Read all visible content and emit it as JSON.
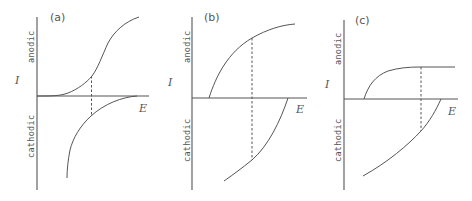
{
  "figure": {
    "panels": [
      {
        "id": "a",
        "label": "(a)",
        "y_upper_label": "anodic",
        "y_lower_label": "cathodic",
        "y_axis_label": "I",
        "x_axis_label": "E"
      },
      {
        "id": "b",
        "label": "(b)",
        "y_upper_label": "anodic",
        "y_lower_label": "cathodic",
        "y_axis_label": "I",
        "x_axis_label": "E"
      },
      {
        "id": "c",
        "label": "(c)",
        "y_upper_label": "anodic",
        "y_lower_label": "cathodic",
        "y_axis_label": "I",
        "x_axis_label": "E"
      }
    ],
    "colors": {
      "line": "#555555",
      "background": "#ffffff"
    }
  }
}
